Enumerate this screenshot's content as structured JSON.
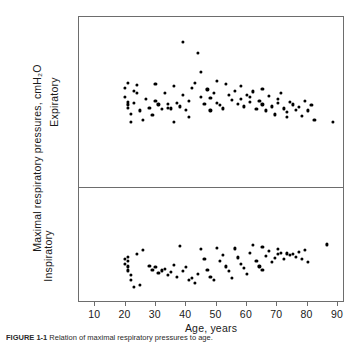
{
  "figure": {
    "caption_label": "FIGURE 1-1",
    "caption_text": "Relation of maximal respiratory pressures to age."
  },
  "axes": {
    "x_title": "Age, years",
    "y_title": "Maximal respiratory pressures, cmH₂O",
    "panel_upper_title": "Expiratory",
    "panel_lower_title": "Inspiratory",
    "x_ticks": [
      10,
      20,
      30,
      40,
      50,
      60,
      70,
      80,
      90
    ],
    "y_ticks_upper": [
      0,
      40,
      80,
      120,
      160,
      200,
      240
    ],
    "y_ticks_lower": [
      0,
      -40,
      -80,
      -120
    ],
    "y_minor_step": 20
  },
  "chart_data": {
    "type": "scatter",
    "title": "",
    "xlabel": "Age, years",
    "ylabel": "Maximal respiratory pressures, cmH2O",
    "xlim": [
      5,
      92
    ],
    "grid": false,
    "legend": "none",
    "marker": "filled-circle",
    "marker_color": "#000000",
    "panels": [
      {
        "name": "Expiratory",
        "ylim": [
          0,
          260
        ],
        "ytick_values": [
          0,
          40,
          80,
          120,
          160,
          200,
          240
        ],
        "points": [
          [
            20,
            152
          ],
          [
            20,
            138
          ],
          [
            21,
            160
          ],
          [
            21,
            131
          ],
          [
            21,
            127
          ],
          [
            21,
            122
          ],
          [
            22,
            113
          ],
          [
            22,
            101
          ],
          [
            23,
            148
          ],
          [
            23,
            130
          ],
          [
            24,
            157
          ],
          [
            24,
            144
          ],
          [
            25,
            118
          ],
          [
            26,
            104
          ],
          [
            27,
            136
          ],
          [
            28,
            122
          ],
          [
            29,
            111
          ],
          [
            30,
            158
          ],
          [
            30,
            133
          ],
          [
            31,
            127
          ],
          [
            32,
            120
          ],
          [
            33,
            145
          ],
          [
            34,
            128
          ],
          [
            34,
            122
          ],
          [
            35,
            121
          ],
          [
            36,
            155
          ],
          [
            36,
            100
          ],
          [
            37,
            129
          ],
          [
            38,
            124
          ],
          [
            39,
            222
          ],
          [
            39,
            141
          ],
          [
            40,
            119
          ],
          [
            41,
            132
          ],
          [
            41,
            108
          ],
          [
            42,
            152
          ],
          [
            43,
            160
          ],
          [
            44,
            205
          ],
          [
            45,
            176
          ],
          [
            45,
            139
          ],
          [
            46,
            128
          ],
          [
            47,
            150
          ],
          [
            48,
            137
          ],
          [
            48,
            118
          ],
          [
            49,
            145
          ],
          [
            50,
            163
          ],
          [
            50,
            130
          ],
          [
            51,
            126
          ],
          [
            52,
            121
          ],
          [
            53,
            158
          ],
          [
            54,
            142
          ],
          [
            55,
            134
          ],
          [
            56,
            148
          ],
          [
            57,
            128
          ],
          [
            58,
            155
          ],
          [
            58,
            136
          ],
          [
            59,
            124
          ],
          [
            60,
            142
          ],
          [
            61,
            139
          ],
          [
            61,
            131
          ],
          [
            62,
            147
          ],
          [
            63,
            120
          ],
          [
            64,
            133
          ],
          [
            65,
            151
          ],
          [
            65,
            127
          ],
          [
            66,
            118
          ],
          [
            67,
            140
          ],
          [
            68,
            124
          ],
          [
            69,
            112
          ],
          [
            70,
            136
          ],
          [
            70,
            129
          ],
          [
            71,
            144
          ],
          [
            72,
            121
          ],
          [
            73,
            116
          ],
          [
            73,
            108
          ],
          [
            74,
            131
          ],
          [
            75,
            127
          ],
          [
            76,
            119
          ],
          [
            77,
            123
          ],
          [
            78,
            110
          ],
          [
            79,
            132
          ],
          [
            80,
            118
          ],
          [
            81,
            126
          ],
          [
            82,
            104
          ],
          [
            88,
            101
          ]
        ]
      },
      {
        "name": "Inspiratory",
        "ylim": [
          -140,
          0
        ],
        "ytick_values": [
          0,
          -40,
          -80,
          -120
        ],
        "points": [
          [
            20,
            -86
          ],
          [
            20,
            -92
          ],
          [
            21,
            -88
          ],
          [
            21,
            -95
          ],
          [
            21,
            -100
          ],
          [
            21,
            -83
          ],
          [
            22,
            -105
          ],
          [
            22,
            -112
          ],
          [
            23,
            -120
          ],
          [
            24,
            -80
          ],
          [
            25,
            -118
          ],
          [
            26,
            -75
          ],
          [
            28,
            -94
          ],
          [
            29,
            -99
          ],
          [
            30,
            -96
          ],
          [
            31,
            -103
          ],
          [
            32,
            -100
          ],
          [
            33,
            -98
          ],
          [
            34,
            -105
          ],
          [
            35,
            -102
          ],
          [
            36,
            -93
          ],
          [
            37,
            -108
          ],
          [
            38,
            -70
          ],
          [
            39,
            -101
          ],
          [
            40,
            -96
          ],
          [
            41,
            -112
          ],
          [
            42,
            -109
          ],
          [
            43,
            -115
          ],
          [
            44,
            -104
          ],
          [
            45,
            -74
          ],
          [
            46,
            -86
          ],
          [
            47,
            -99
          ],
          [
            48,
            -108
          ],
          [
            49,
            -112
          ],
          [
            50,
            -72
          ],
          [
            51,
            -88
          ],
          [
            52,
            -81
          ],
          [
            53,
            -95
          ],
          [
            54,
            -101
          ],
          [
            55,
            -109
          ],
          [
            56,
            -73
          ],
          [
            57,
            -84
          ],
          [
            58,
            -92
          ],
          [
            59,
            -97
          ],
          [
            60,
            -104
          ],
          [
            61,
            -78
          ],
          [
            62,
            -69
          ],
          [
            63,
            -88
          ],
          [
            64,
            -95
          ],
          [
            65,
            -71
          ],
          [
            65,
            -99
          ],
          [
            66,
            -82
          ],
          [
            67,
            -76
          ],
          [
            68,
            -90
          ],
          [
            69,
            -85
          ],
          [
            70,
            -74
          ],
          [
            70,
            -80
          ],
          [
            71,
            -78
          ],
          [
            72,
            -86
          ],
          [
            73,
            -79
          ],
          [
            74,
            -81
          ],
          [
            75,
            -80
          ],
          [
            76,
            -83
          ],
          [
            77,
            -77
          ],
          [
            78,
            -86
          ],
          [
            79,
            -75
          ],
          [
            80,
            -90
          ],
          [
            86,
            -68
          ]
        ]
      }
    ]
  }
}
